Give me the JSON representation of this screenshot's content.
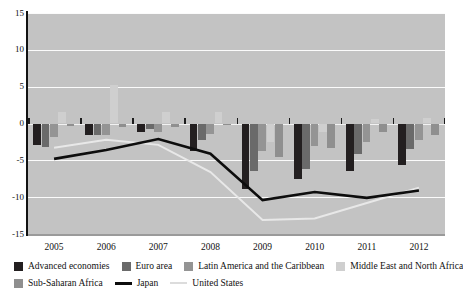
{
  "chart_data": {
    "type": "bar",
    "title": "",
    "subtitle": "",
    "xlabel": "",
    "ylabel": "",
    "ylim": [
      -15,
      15
    ],
    "ytick_labels": [
      "15",
      "10",
      "5",
      "0",
      "-5",
      "-10",
      "-15"
    ],
    "ytick_values": [
      15,
      10,
      5,
      0,
      -5,
      -10,
      -15
    ],
    "grid": true,
    "grid_axis": "y",
    "legend_position": "bottom",
    "categories": [
      "2005",
      "2006",
      "2007",
      "2008",
      "2009",
      "2010",
      "2011",
      "2012"
    ],
    "bar_series": [
      {
        "name": "Advanced economies",
        "color": "#231f20",
        "values": [
          -2.9,
          -1.6,
          -1.2,
          -3.7,
          -8.9,
          -7.6,
          -6.4,
          -5.6
        ]
      },
      {
        "name": "Euro area",
        "color": "#6a6a6a",
        "values": [
          -3.2,
          -1.5,
          -0.8,
          -2.2,
          -6.4,
          -6.2,
          -4.2,
          -3.4
        ]
      },
      {
        "name": "Latin America and the Caribbean",
        "color": "#949494",
        "values": [
          -1.9,
          -1.6,
          -1.2,
          -1.4,
          -3.8,
          -3.0,
          -2.5,
          -2.3
        ]
      },
      {
        "name": "Middle East and North Africa",
        "color": "#cfcfcf",
        "values": [
          1.5,
          5.2,
          1.6,
          1.6,
          -2.5,
          -1.2,
          0.6,
          0.7
        ]
      },
      {
        "name": "Sub-Saharan Africa",
        "color": "#8f8f8f",
        "values": [
          -0.4,
          -0.5,
          -0.5,
          -0.2,
          -4.6,
          -3.3,
          -1.2,
          -1.5
        ]
      }
    ],
    "line_series": [
      {
        "name": "Japan",
        "color": "#0d0d0d",
        "style": "solid",
        "width": 2.6,
        "values": [
          -4.8,
          -3.6,
          -2.1,
          -4.1,
          -10.4,
          -9.3,
          -10.1,
          -9.1
        ]
      },
      {
        "name": "United States",
        "color": "#e8e8e8",
        "style": "solid",
        "width": 2.0,
        "values": [
          -3.3,
          -2.2,
          -2.9,
          -6.6,
          -13.1,
          -12.9,
          -10.8,
          -8.7
        ]
      }
    ]
  },
  "legend": {
    "items": [
      {
        "label": "Advanced economies",
        "color": "#231f20",
        "marker": "square"
      },
      {
        "label": "Euro area",
        "color": "#6a6a6a",
        "marker": "square"
      },
      {
        "label": "Latin America and the Caribbean",
        "color": "#949494",
        "marker": "square"
      },
      {
        "label": "Middle East and North Africa",
        "color": "#cfcfcf",
        "marker": "square"
      },
      {
        "label": "Sub-Saharan Africa",
        "color": "#8f8f8f",
        "marker": "square"
      },
      {
        "label": "Japan",
        "color": "#0d0d0d",
        "marker": "line"
      },
      {
        "label": "United States",
        "color": "#dcdcdc",
        "marker": "line-thin"
      }
    ]
  },
  "axes": {
    "y_labels": [
      "15",
      "10",
      "5",
      "0",
      "-5",
      "-10",
      "-15"
    ],
    "x_labels": [
      "2005",
      "2006",
      "2007",
      "2008",
      "2009",
      "2010",
      "2011",
      "2012"
    ]
  },
  "colors": {
    "plot_background": "#c3c3c3",
    "gridline": "#fbfbfb",
    "axis": "#121212",
    "page_background": "#ffffff"
  }
}
